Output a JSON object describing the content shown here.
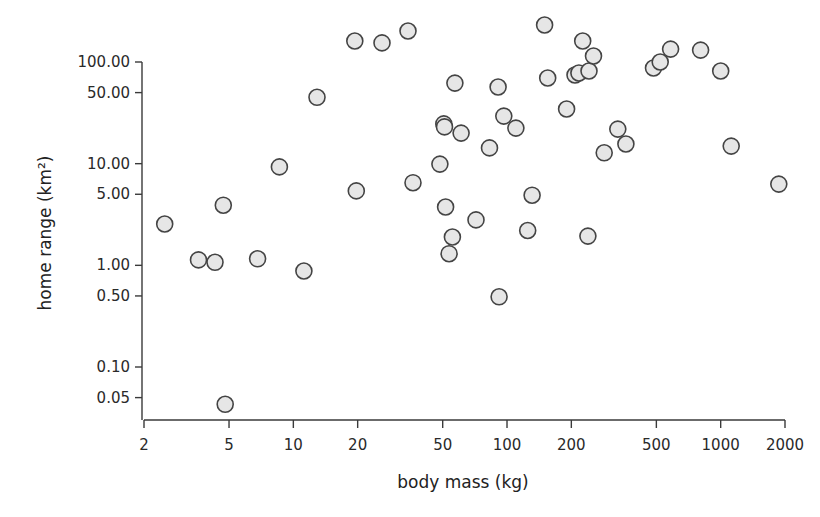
{
  "chart_data": {
    "type": "scatter",
    "title": "",
    "xlabel": "body mass (kg)",
    "ylabel": "home range (km²)",
    "xscale": "log",
    "yscale": "log",
    "xlim": [
      2,
      2000
    ],
    "ylim": [
      0.04,
      250
    ],
    "grid": false,
    "legend": null,
    "x_ticks": [
      2,
      5,
      10,
      20,
      50,
      100,
      200,
      500,
      1000,
      2000
    ],
    "x_tick_labels": [
      "2",
      "5",
      "10",
      "20",
      "50",
      "100",
      "200",
      "500",
      "1000",
      "2000"
    ],
    "y_ticks": [
      100,
      50,
      10,
      5,
      1,
      0.5,
      0.1,
      0.05
    ],
    "y_tick_labels": [
      "100.00",
      "50.00",
      "10.00",
      "5.00",
      "1.00",
      "0.50",
      "0.10",
      "0.05"
    ],
    "marker": {
      "shape": "circle",
      "fill": "#e6e6e6",
      "stroke": "#444444"
    },
    "points": [
      {
        "x": 2.5,
        "y": 2.55
      },
      {
        "x": 3.6,
        "y": 1.13
      },
      {
        "x": 4.3,
        "y": 1.07
      },
      {
        "x": 4.7,
        "y": 3.9
      },
      {
        "x": 4.8,
        "y": 0.043
      },
      {
        "x": 6.8,
        "y": 1.16
      },
      {
        "x": 11.2,
        "y": 0.88
      },
      {
        "x": 8.6,
        "y": 9.3
      },
      {
        "x": 12.9,
        "y": 45
      },
      {
        "x": 19.4,
        "y": 161
      },
      {
        "x": 26,
        "y": 154
      },
      {
        "x": 34.4,
        "y": 202
      },
      {
        "x": 19.7,
        "y": 5.4
      },
      {
        "x": 36.3,
        "y": 6.5
      },
      {
        "x": 48.5,
        "y": 9.9
      },
      {
        "x": 50.6,
        "y": 24.6
      },
      {
        "x": 51,
        "y": 23
      },
      {
        "x": 51.6,
        "y": 3.75
      },
      {
        "x": 55.5,
        "y": 1.9
      },
      {
        "x": 53.6,
        "y": 1.3
      },
      {
        "x": 57,
        "y": 62
      },
      {
        "x": 61,
        "y": 20
      },
      {
        "x": 71.6,
        "y": 2.8
      },
      {
        "x": 82.8,
        "y": 14.3
      },
      {
        "x": 90.8,
        "y": 56.8
      },
      {
        "x": 91.8,
        "y": 0.49
      },
      {
        "x": 96.6,
        "y": 29.4
      },
      {
        "x": 110,
        "y": 22.4
      },
      {
        "x": 125,
        "y": 2.2
      },
      {
        "x": 131,
        "y": 4.9
      },
      {
        "x": 150,
        "y": 231
      },
      {
        "x": 155,
        "y": 69.6
      },
      {
        "x": 190,
        "y": 34.5
      },
      {
        "x": 208,
        "y": 74.5
      },
      {
        "x": 217,
        "y": 78
      },
      {
        "x": 226,
        "y": 161
      },
      {
        "x": 242,
        "y": 81.6
      },
      {
        "x": 254,
        "y": 114.6
      },
      {
        "x": 239,
        "y": 1.94
      },
      {
        "x": 285,
        "y": 12.8
      },
      {
        "x": 330,
        "y": 21.9
      },
      {
        "x": 360,
        "y": 15.6
      },
      {
        "x": 485,
        "y": 87.3
      },
      {
        "x": 521,
        "y": 100
      },
      {
        "x": 583,
        "y": 134
      },
      {
        "x": 805,
        "y": 131
      },
      {
        "x": 1000,
        "y": 81.6
      },
      {
        "x": 1120,
        "y": 14.9
      },
      {
        "x": 1870,
        "y": 6.3
      }
    ]
  },
  "layout": {
    "x_axis": {
      "y_px": 420,
      "x_min_px": 144,
      "x_max_px": 785,
      "v_min": 2,
      "v_max": 2000
    },
    "y_axis": {
      "x_px": 142,
      "y_top_px": 62,
      "y_bottom_px": 367,
      "v_top": 100,
      "v_bottom": 0.1,
      "line_top_px": 62,
      "line_bottom_px": 420
    },
    "marker_radius": 8
  }
}
